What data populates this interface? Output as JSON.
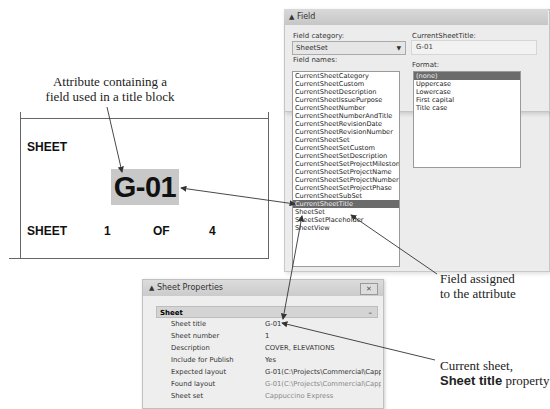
{
  "callouts": {
    "attribute": [
      "Attribute containing a",
      "field used in a title block"
    ],
    "field_assigned": [
      "Field assigned",
      "to the attribute"
    ],
    "current_sheet_line1": "Current sheet,",
    "current_sheet_bold": "Sheet title",
    "current_sheet_rest": " property"
  },
  "title_block": {
    "sheet_label": "SHEET",
    "sheet_value": "G-01",
    "row_sheet": "SHEET",
    "row_number": "1",
    "row_of": "OF",
    "row_total": "4",
    "highlight_color": "#c8c8c8"
  },
  "field_dialog": {
    "title": "Field",
    "category_label": "Field category:",
    "category_value": "SheetSet",
    "names_label": "Field names:",
    "names": [
      "CurrentSheetCategory",
      "CurrentSheetCustom",
      "CurrentSheetDescription",
      "CurrentSheetIssuePurpose",
      "CurrentSheetNumber",
      "CurrentSheetNumberAndTitle",
      "CurrentSheetRevisionDate",
      "CurrentSheetRevisionNumber",
      "CurrentSheetSet",
      "CurrentSheetSetCustom",
      "CurrentSheetSetDescription",
      "CurrentSheetSetProjectMilestone",
      "CurrentSheetSetProjectName",
      "CurrentSheetSetProjectNumber",
      "CurrentSheetSetProjectPhase",
      "CurrentSheetSubSet",
      "CurrentSheetTitle",
      "SheetSet",
      "SheetSetPlaceholder",
      "SheetView"
    ],
    "selected_name_index": 16,
    "value_label": "CurrentSheetTitle:",
    "value": "G-01",
    "format_label": "Format:",
    "formats": [
      "(none)",
      "Uppercase",
      "Lowercase",
      "First capital",
      "Title case"
    ],
    "selected_format_index": 0
  },
  "sheet_properties": {
    "title": "Sheet Properties",
    "close": "✕",
    "group": "Sheet",
    "group_toggle": "–",
    "rows": [
      {
        "key": "Sheet title",
        "value": "G-01"
      },
      {
        "key": "Sheet number",
        "value": "1"
      },
      {
        "key": "Description",
        "value": "COVER, ELEVATIONS"
      },
      {
        "key": "Include for Publish",
        "value": "Yes"
      },
      {
        "key": "Expected layout",
        "value": "G-01(C:\\Projects\\Commercial\\Cappuccino Expr..."
      },
      {
        "key": "Found layout",
        "value": "G-01(C:\\Projects\\Commercial\\Cappuccino Expr..."
      },
      {
        "key": "Sheet set",
        "value": "Cappuccino Express"
      }
    ]
  }
}
